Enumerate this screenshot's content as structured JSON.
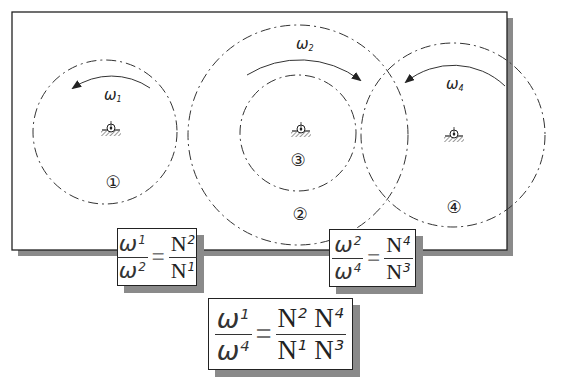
{
  "diagram": {
    "gears": [
      {
        "id": "1",
        "label": "①",
        "omega": "ω",
        "omega_sub": "1",
        "rotation": "counterclockwise"
      },
      {
        "id": "2",
        "label": "②",
        "omega": "ω",
        "omega_sub": "2",
        "rotation": "clockwise"
      },
      {
        "id": "3",
        "label": "③"
      },
      {
        "id": "4",
        "label": "④",
        "omega": "ω",
        "omega_sub": "4",
        "rotation": "counterclockwise"
      }
    ],
    "equations": {
      "eq1": {
        "lhs_num": "ω",
        "lhs_num_sub": "1",
        "lhs_den": "ω",
        "lhs_den_sub": "2",
        "eq": "=",
        "rhs_num": "N",
        "rhs_num_sub": "2",
        "rhs_den": "N",
        "rhs_den_sub": "1"
      },
      "eq2": {
        "lhs_num": "ω",
        "lhs_num_sub": "2",
        "lhs_den": "ω",
        "lhs_den_sub": "4",
        "eq": "=",
        "rhs_num": "N",
        "rhs_num_sub": "4",
        "rhs_den": "N",
        "rhs_den_sub": "3"
      },
      "eq3": {
        "lhs_num": "ω",
        "lhs_num_sub": "1",
        "lhs_den": "ω",
        "lhs_den_sub": "4",
        "eq": "=",
        "rhs_num_a": "N",
        "rhs_num_a_sub": "2",
        "rhs_num_b": "N",
        "rhs_num_b_sub": "4",
        "rhs_den_a": "N",
        "rhs_den_a_sub": "1",
        "rhs_den_b": "N",
        "rhs_den_b_sub": "3"
      }
    }
  }
}
